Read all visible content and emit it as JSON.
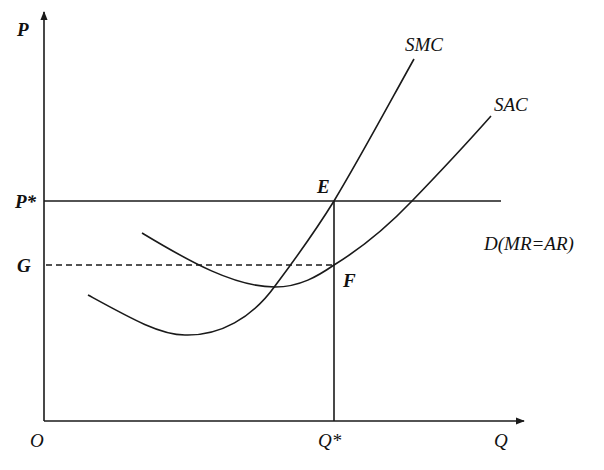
{
  "diagram": {
    "title": "",
    "axes": {
      "y_label": "P",
      "x_label": "Q",
      "origin_label": "O"
    },
    "price_levels": {
      "p_star": "P*",
      "g": "G"
    },
    "quantity_levels": {
      "q_star": "Q*"
    },
    "curves": {
      "smc": "SMC",
      "sac": "SAC",
      "demand": "D(MR=AR)"
    },
    "points": {
      "e": "E",
      "f": "F"
    },
    "colors": {
      "line": "#1a1a1a",
      "background": "#ffffff"
    }
  }
}
